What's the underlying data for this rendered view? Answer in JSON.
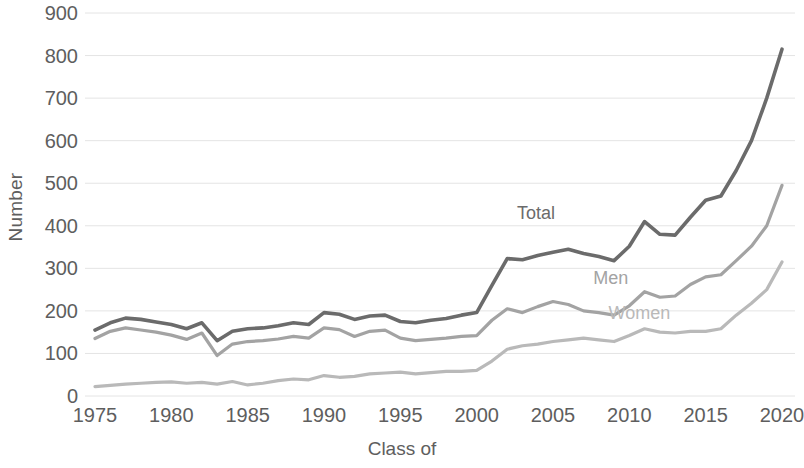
{
  "chart_data": {
    "type": "line",
    "title": "",
    "xlabel": "Class of",
    "ylabel": "Number",
    "xlim": [
      1975,
      2020
    ],
    "ylim": [
      0,
      900
    ],
    "ytick_labels": [
      "900",
      "800",
      "700",
      "600",
      "500",
      "400",
      "300",
      "200",
      "100",
      "0"
    ],
    "ytick_values": [
      900,
      800,
      700,
      600,
      500,
      400,
      300,
      200,
      100,
      0
    ],
    "xtick_labels": [
      "1975",
      "1980",
      "1985",
      "1990",
      "1995",
      "2000",
      "2005",
      "2010",
      "2015",
      "2020"
    ],
    "xtick_values": [
      1975,
      1980,
      1985,
      1990,
      1995,
      2000,
      2005,
      2010,
      2015,
      2020
    ],
    "grid": true,
    "grid_axis": "y",
    "legend_position": "inline-labels",
    "colors": {
      "total": "#6b6b6b",
      "men": "#a3a3a3",
      "women": "#b9b9b9",
      "gridline": "#e4e4e4",
      "text": "#5e5e5e",
      "background": "#ffffff"
    },
    "x": [
      1975,
      1976,
      1977,
      1978,
      1979,
      1980,
      1981,
      1982,
      1983,
      1984,
      1985,
      1986,
      1987,
      1988,
      1989,
      1990,
      1991,
      1992,
      1993,
      1994,
      1995,
      1996,
      1997,
      1998,
      1999,
      2000,
      2001,
      2002,
      2003,
      2004,
      2005,
      2006,
      2007,
      2008,
      2009,
      2010,
      2011,
      2012,
      2013,
      2014,
      2015,
      2016,
      2017,
      2018,
      2019,
      2020
    ],
    "series": [
      {
        "name": "Total",
        "color": "#6b6b6b",
        "label_x": 2005,
        "label_y": 430,
        "values": [
          155,
          172,
          183,
          180,
          174,
          168,
          158,
          172,
          130,
          152,
          158,
          160,
          165,
          172,
          168,
          196,
          192,
          180,
          188,
          190,
          175,
          172,
          178,
          182,
          190,
          196,
          260,
          323,
          320,
          330,
          338,
          345,
          335,
          328,
          318,
          352,
          410,
          380,
          378,
          420,
          460,
          470,
          530,
          600,
          700,
          815
        ]
      },
      {
        "name": "Men",
        "color": "#a3a3a3",
        "label_x": 2010,
        "label_y": 278,
        "values": [
          135,
          152,
          160,
          155,
          150,
          143,
          133,
          148,
          95,
          122,
          128,
          130,
          134,
          140,
          136,
          160,
          156,
          140,
          152,
          155,
          136,
          130,
          133,
          136,
          140,
          142,
          178,
          205,
          196,
          210,
          222,
          215,
          200,
          196,
          190,
          212,
          245,
          232,
          235,
          262,
          280,
          285,
          318,
          352,
          400,
          495
        ]
      },
      {
        "name": "Women",
        "color": "#b9b9b9",
        "label_x": 2011,
        "label_y": 195,
        "values": [
          22,
          25,
          28,
          30,
          32,
          33,
          30,
          32,
          28,
          34,
          26,
          30,
          36,
          40,
          38,
          48,
          44,
          46,
          52,
          54,
          56,
          52,
          55,
          58,
          58,
          60,
          82,
          110,
          118,
          122,
          128,
          132,
          136,
          132,
          128,
          142,
          158,
          150,
          148,
          152,
          152,
          158,
          190,
          218,
          250,
          315
        ]
      }
    ]
  }
}
